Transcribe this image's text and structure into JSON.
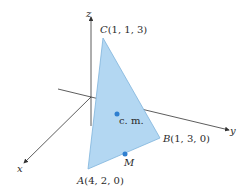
{
  "diagram": {
    "axes": {
      "x": {
        "label": "x"
      },
      "y": {
        "label": "y"
      },
      "z": {
        "label": "z"
      }
    },
    "vertices": {
      "A": {
        "name": "A",
        "coords": "(4, 2, 0)"
      },
      "B": {
        "name": "B",
        "coords": "(1, 3, 0)"
      },
      "C": {
        "name": "C",
        "coords": "(1, 1, 3)"
      }
    },
    "points": {
      "center_of_mass": {
        "label": "c. m."
      },
      "midpoint": {
        "label": "M"
      }
    },
    "colors": {
      "triangle_fill": "#b3d7f2",
      "triangle_edge": "#7fb4dc",
      "point": "#2f7fd0",
      "axis": "#333333"
    }
  }
}
